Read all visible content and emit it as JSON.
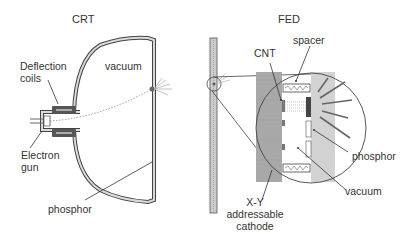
{
  "crt": {
    "title": "CRT",
    "labels": {
      "deflection_line1": "Deflection",
      "deflection_line2": "coils",
      "vacuum": "vacuum",
      "electron_line1": "Electron",
      "electron_line2": "gun",
      "phosphor": "phosphor"
    }
  },
  "fed": {
    "title": "FED",
    "labels": {
      "cnt": "CNT",
      "spacer": "spacer",
      "phosphor": "phosphor",
      "vacuum": "vacuum",
      "cathode_line1": "X-Y",
      "cathode_line2": "addressable",
      "cathode_line3": "cathode"
    }
  },
  "colors": {
    "outline": "#444444",
    "glass": "#d9d9d9",
    "coil": "#555555",
    "cathode": "#a8a8a8",
    "phosphor_plate": "#cfcfcf",
    "text": "#333333"
  }
}
